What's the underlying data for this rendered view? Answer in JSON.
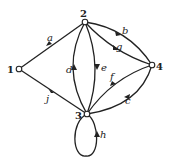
{
  "graph": {
    "type": "directed multigraph",
    "nodes": [
      {
        "id": "1",
        "label": "1",
        "x": 19,
        "y": 69
      },
      {
        "id": "2",
        "label": "2",
        "x": 85,
        "y": 22
      },
      {
        "id": "3",
        "label": "3",
        "x": 87,
        "y": 114
      },
      {
        "id": "4",
        "label": "4",
        "x": 152,
        "y": 65
      }
    ],
    "edges": [
      {
        "label": "a",
        "from": "1",
        "to": "2"
      },
      {
        "label": "b",
        "from": "2",
        "to": "4"
      },
      {
        "label": "c",
        "from": "4",
        "to": "3"
      },
      {
        "label": "d",
        "from": "3",
        "to": "2"
      },
      {
        "label": "e",
        "from": "2",
        "to": "3"
      },
      {
        "label": "f",
        "from": "3",
        "to": "4"
      },
      {
        "label": "g",
        "from": "2",
        "to": "4"
      },
      {
        "label": "h",
        "from": "3",
        "to": "3"
      },
      {
        "label": "j",
        "from": "1",
        "to": "3"
      }
    ]
  }
}
